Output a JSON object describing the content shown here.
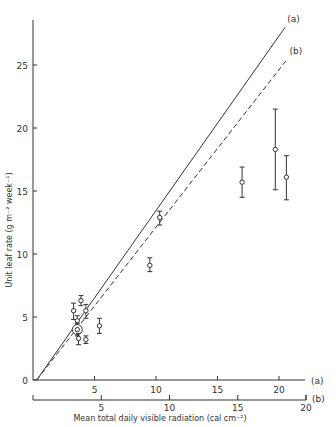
{
  "chart_data": {
    "type": "scatter",
    "title": "",
    "xlabel": "Mean total daily visible radiation (cal cm⁻²)",
    "ylabel": "Unit leaf rate (g m⁻² week⁻¹)",
    "xlim": [
      0,
      22
    ],
    "ylim": [
      0,
      28
    ],
    "grid": false,
    "x_axes": [
      {
        "label": "(a)",
        "ticks": [
          5,
          10,
          15,
          20
        ]
      },
      {
        "label": "(b)",
        "ticks": [
          5,
          10,
          15,
          20
        ]
      }
    ],
    "y_ticks": [
      0,
      5,
      10,
      15,
      20,
      25
    ],
    "series": [
      {
        "name": "observed",
        "marker": "open-circle",
        "error_bars": true,
        "points": [
          {
            "x": 3.3,
            "y": 5.5,
            "ylo": 4.8,
            "yhi": 6.1
          },
          {
            "x": 3.9,
            "y": 6.3,
            "ylo": 5.9,
            "yhi": 6.7
          },
          {
            "x": 4.3,
            "y": 5.5,
            "ylo": 4.9,
            "yhi": 6.0
          },
          {
            "x": 3.6,
            "y": 4.7,
            "ylo": 4.2,
            "yhi": 5.1
          },
          {
            "x": 3.6,
            "y": 4.0,
            "ylo": 3.5,
            "yhi": 4.5,
            "circled": true
          },
          {
            "x": 3.7,
            "y": 3.3,
            "ylo": 2.8,
            "yhi": 3.7
          },
          {
            "x": 4.3,
            "y": 3.2,
            "ylo": 2.9,
            "yhi": 3.5
          },
          {
            "x": 5.4,
            "y": 4.3,
            "ylo": 3.7,
            "yhi": 4.9
          },
          {
            "x": 9.5,
            "y": 9.1,
            "ylo": 8.6,
            "yhi": 9.7
          },
          {
            "x": 10.3,
            "y": 12.9,
            "ylo": 12.3,
            "yhi": 13.4
          },
          {
            "x": 17.0,
            "y": 15.7,
            "ylo": 14.5,
            "yhi": 16.9
          },
          {
            "x": 19.7,
            "y": 18.3,
            "ylo": 15.1,
            "yhi": 21.5
          },
          {
            "x": 20.6,
            "y": 16.1,
            "ylo": 14.3,
            "yhi": 17.8
          }
        ]
      },
      {
        "name": "(a)",
        "style": "solid",
        "line": [
          [
            0.3,
            0
          ],
          [
            20.5,
            28.0
          ]
        ]
      },
      {
        "name": "(b)",
        "style": "dashed",
        "line": [
          [
            0.3,
            0
          ],
          [
            20.7,
            25.5
          ]
        ]
      }
    ],
    "annotations": [
      "(a)",
      "(b)"
    ]
  }
}
